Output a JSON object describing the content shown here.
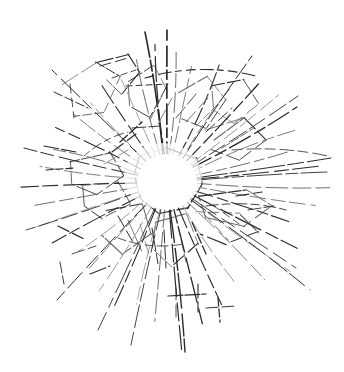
{
  "artwork": {
    "title": "Shattered glass impact star",
    "medium": "line drawing",
    "canvas": {
      "width": 344,
      "height": 372
    },
    "background_color": "#ffffff",
    "ink_color": "#2b2b2b",
    "ink_color_light": "#6e6e6e",
    "ink_color_faint": "#9a9a9a",
    "impact_center": {
      "x": 167,
      "y": 182
    },
    "core_void": {
      "label": "white impact void",
      "cx": 167,
      "cy": 182,
      "rx": 30,
      "ry": 28
    },
    "bounding_box": {
      "x": 22,
      "y": 30,
      "width": 310,
      "height": 325
    }
  },
  "chart_data": {
    "type": "scatter",
    "xlabel": "",
    "ylabel": "",
    "grid": false,
    "legend": null,
    "xlim": [
      0,
      344
    ],
    "ylim": [
      0,
      372
    ],
    "center": [
      167,
      182
    ],
    "radial_rays": [
      {
        "angle_deg": -90,
        "length": 152,
        "weight": 1.7,
        "dash": "14 5 9 4 20 6"
      },
      {
        "angle_deg": -78,
        "length": 118,
        "weight": 0.9,
        "dash": "10 5 16 4"
      },
      {
        "angle_deg": -66,
        "length": 128,
        "weight": 1.1,
        "dash": "18 4 11 5"
      },
      {
        "angle_deg": -56,
        "length": 112,
        "weight": 0.8,
        "dash": "9 4 14 5"
      },
      {
        "angle_deg": -47,
        "length": 134,
        "weight": 1.2,
        "dash": "22 5 13 4"
      },
      {
        "angle_deg": -38,
        "length": 142,
        "weight": 1.0,
        "dash": "16 4 20 6"
      },
      {
        "angle_deg": -30,
        "length": 150,
        "weight": 1.3,
        "dash": "24 5 12 4"
      },
      {
        "angle_deg": -22,
        "length": 138,
        "weight": 0.9,
        "dash": "12 4 18 5"
      },
      {
        "angle_deg": -14,
        "length": 126,
        "weight": 1.0,
        "dash": "20 5 10 4"
      },
      {
        "angle_deg": -6,
        "length": 155,
        "weight": 1.1,
        "dash": "26 6 14 4"
      },
      {
        "angle_deg": 2,
        "length": 163,
        "weight": 1.0,
        "dash": "18 5 22 5"
      },
      {
        "angle_deg": 9,
        "length": 150,
        "weight": 0.9,
        "dash": "14 4 16 6"
      },
      {
        "angle_deg": 18,
        "length": 128,
        "weight": 1.1,
        "dash": "22 5 11 4"
      },
      {
        "angle_deg": 27,
        "length": 146,
        "weight": 1.2,
        "dash": "28 6 13 4"
      },
      {
        "angle_deg": 36,
        "length": 152,
        "weight": 1.0,
        "dash": "20 5 17 5"
      },
      {
        "angle_deg": 45,
        "length": 138,
        "weight": 0.9,
        "dash": "15 4 21 6"
      },
      {
        "angle_deg": 56,
        "length": 120,
        "weight": 1.0,
        "dash": "18 5 12 4"
      },
      {
        "angle_deg": 66,
        "length": 134,
        "weight": 1.1,
        "dash": "24 5 14 4"
      },
      {
        "angle_deg": 76,
        "length": 148,
        "weight": 1.3,
        "dash": "16 4 26 6"
      },
      {
        "angle_deg": 85,
        "length": 168,
        "weight": 1.2,
        "dash": "30 6 18 5"
      },
      {
        "angle_deg": 95,
        "length": 140,
        "weight": 1.0,
        "dash": "20 5 14 4"
      },
      {
        "angle_deg": 104,
        "length": 126,
        "weight": 0.9,
        "dash": "13 4 19 5"
      },
      {
        "angle_deg": 113,
        "length": 136,
        "weight": 1.1,
        "dash": "22 5 12 4"
      },
      {
        "angle_deg": 122,
        "length": 128,
        "weight": 1.0,
        "dash": "17 4 20 6"
      },
      {
        "angle_deg": 132,
        "length": 120,
        "weight": 0.9,
        "dash": "14 5 15 4"
      },
      {
        "angle_deg": 142,
        "length": 112,
        "weight": 1.0,
        "dash": "19 4 13 5"
      },
      {
        "angle_deg": 152,
        "length": 130,
        "weight": 1.1,
        "dash": "24 5 11 4"
      },
      {
        "angle_deg": 161,
        "length": 142,
        "weight": 0.9,
        "dash": "16 5 22 6"
      },
      {
        "angle_deg": 170,
        "length": 134,
        "weight": 1.0,
        "dash": "21 4 14 5"
      },
      {
        "angle_deg": 178,
        "length": 146,
        "weight": 1.1,
        "dash": "26 6 15 4"
      },
      {
        "angle_deg": 187,
        "length": 128,
        "weight": 0.9,
        "dash": "14 4 18 5"
      },
      {
        "angle_deg": 196,
        "length": 118,
        "weight": 1.0,
        "dash": "18 5 13 4"
      },
      {
        "angle_deg": 206,
        "length": 124,
        "weight": 1.1,
        "dash": "22 5 12 5"
      },
      {
        "angle_deg": 216,
        "length": 116,
        "weight": 0.9,
        "dash": "15 4 19 5"
      },
      {
        "angle_deg": 226,
        "length": 110,
        "weight": 1.0,
        "dash": "20 5 11 4"
      },
      {
        "angle_deg": 236,
        "length": 120,
        "weight": 1.1,
        "dash": "17 4 21 6"
      },
      {
        "angle_deg": 246,
        "length": 112,
        "weight": 0.9,
        "dash": "13 5 16 4"
      },
      {
        "angle_deg": 256,
        "length": 126,
        "weight": 1.0,
        "dash": "24 5 12 4"
      },
      {
        "angle_deg": 265,
        "length": 138,
        "weight": 1.2,
        "dash": "18 4 25 6"
      },
      {
        "angle_deg": 274,
        "length": 130,
        "weight": 1.0,
        "dash": "20 5 14 5"
      }
    ],
    "long_rays": [
      {
        "from": [
          167,
          182
        ],
        "to": [
          145,
          32
        ],
        "weight": 1.6
      },
      {
        "from": [
          167,
          182
        ],
        "to": [
          185,
          352
        ],
        "weight": 1.4
      },
      {
        "from": [
          167,
          182
        ],
        "to": [
          331,
          158
        ],
        "weight": 1.0
      },
      {
        "from": [
          167,
          182
        ],
        "to": [
          327,
          172
        ],
        "weight": 0.9
      },
      {
        "from": [
          167,
          182
        ],
        "to": [
          310,
          290
        ],
        "weight": 1.0
      },
      {
        "from": [
          167,
          182
        ],
        "to": [
          296,
          268
        ],
        "weight": 0.9
      },
      {
        "from": [
          167,
          182
        ],
        "to": [
          24,
          148
        ],
        "weight": 1.0
      },
      {
        "from": [
          167,
          182
        ],
        "to": [
          26,
          230
        ],
        "weight": 0.9
      },
      {
        "from": [
          167,
          182
        ],
        "to": [
          57,
          300
        ],
        "weight": 1.0
      },
      {
        "from": [
          167,
          182
        ],
        "to": [
          98,
          330
        ],
        "weight": 0.9
      },
      {
        "from": [
          167,
          182
        ],
        "to": [
          52,
          70
        ],
        "weight": 1.0
      },
      {
        "from": [
          167,
          182
        ],
        "to": [
          252,
          56
        ],
        "weight": 1.0
      },
      {
        "from": [
          167,
          182
        ],
        "to": [
          298,
          96
        ],
        "weight": 0.9
      },
      {
        "from": [
          167,
          182
        ],
        "to": [
          131,
          345
        ],
        "weight": 0.9
      }
    ],
    "facets": [
      {
        "label": "shard-upper-left-a",
        "points": "62,84 96,62 120,76 104,112 74,116"
      },
      {
        "label": "shard-upper-left-b",
        "points": "96,62 128,54 139,72 122,94 106,80"
      },
      {
        "label": "shard-upper-mid",
        "points": "128,82 154,66 166,88 150,118 130,106"
      },
      {
        "label": "shard-upper-right-a",
        "points": "178,92 208,76 226,100 206,128 182,118"
      },
      {
        "label": "shard-upper-right-b",
        "points": "212,86 244,80 258,104 234,124 214,110"
      },
      {
        "label": "shard-right-a",
        "points": "206,130 244,118 266,140 240,160 212,150"
      },
      {
        "label": "shard-right-b",
        "points": "198,196 246,190 272,206 244,226 206,218"
      },
      {
        "label": "shard-right-c",
        "points": "196,212 240,214 258,232 226,244 200,234"
      },
      {
        "label": "shard-lower-mid",
        "points": "156,222 186,214 198,244 172,266 152,248"
      },
      {
        "label": "shard-lower-left-a",
        "points": "106,210 142,204 152,234 122,254 102,236"
      },
      {
        "label": "shard-left-a",
        "points": "70,162 110,152 124,176 96,194 72,184"
      },
      {
        "label": "shard-left-b",
        "points": "82,186 118,182 130,204 102,218 84,206"
      },
      {
        "label": "shard-core-ring",
        "points": "140,156 166,148 196,158 202,184 188,208 160,214 140,198 134,174"
      }
    ],
    "arcs": [
      {
        "label": "upper-dashed-arc",
        "d": "M145,78 Q200,62 256,76",
        "weight": 1.1,
        "dash": "9 5 13 4 6 5"
      },
      {
        "label": "inner-arc-left",
        "d": "M84,156 Q104,138 128,132",
        "weight": 0.8,
        "dash": "7 4 10 4"
      },
      {
        "label": "inner-arc-right",
        "d": "M206,206 Q250,200 286,210",
        "weight": 0.9,
        "dash": "12 4 8 5"
      },
      {
        "label": "inner-arc-lower",
        "d": "M118,238 Q150,250 184,244",
        "weight": 0.8,
        "dash": "8 4 11 5"
      },
      {
        "label": "outer-arc-right",
        "d": "M232,150 Q282,146 328,156",
        "weight": 0.8,
        "dash": "10 5 14 4"
      }
    ],
    "tick_marks": [
      {
        "label": "tick-vertical-top",
        "d": "M126,86 L168,84"
      },
      {
        "label": "tick-vertical-upper",
        "d": "M132,128 L160,126"
      },
      {
        "label": "tick-upper-left-1",
        "d": "M54,92 L88,108"
      },
      {
        "label": "tick-upper-left-2",
        "d": "M70,84 L74,118"
      },
      {
        "label": "tick-upper-left-3",
        "d": "M100,66 L128,58"
      },
      {
        "label": "tick-upper-left-4",
        "d": "M112,78 L136,70"
      },
      {
        "label": "tick-lower-left-1",
        "d": "M58,226 L86,240"
      },
      {
        "label": "tick-lower-left-2",
        "d": "M72,254 L96,246"
      },
      {
        "label": "tick-lower-left-3",
        "d": "M90,274 L110,266"
      },
      {
        "label": "tick-lower-left-4",
        "d": "M60,262 L64,284"
      },
      {
        "label": "tick-bottom-1",
        "d": "M176,288 L176,318"
      },
      {
        "label": "tick-bottom-2",
        "d": "M198,284 L198,312"
      },
      {
        "label": "tick-bottom-3",
        "d": "M168,296 L206,294"
      },
      {
        "label": "tick-bottom-4",
        "d": "M206,308 L236,306"
      },
      {
        "label": "tick-bottom-5",
        "d": "M218,298 L220,322"
      },
      {
        "label": "tick-right-1",
        "d": "M236,196 L262,192"
      },
      {
        "label": "tick-right-2",
        "d": "M248,210 L274,206"
      },
      {
        "label": "tick-left-1",
        "d": "M44,146 L76,152"
      },
      {
        "label": "tick-left-2",
        "d": "M46,170 L74,168"
      }
    ],
    "hatch_strokes": [
      {
        "d": "M150,120 L162,96"
      },
      {
        "d": "M158,124 L172,98"
      },
      {
        "d": "M176,118 L196,94"
      },
      {
        "d": "M186,122 L208,98"
      },
      {
        "d": "M196,126 L220,102"
      },
      {
        "d": "M206,132 L232,108"
      },
      {
        "d": "M214,140 L244,118"
      },
      {
        "d": "M222,148 L254,128"
      },
      {
        "d": "M120,142 L142,122"
      },
      {
        "d": "M112,152 L136,134"
      },
      {
        "d": "M104,164 L128,150"
      },
      {
        "d": "M118,216 L134,244"
      },
      {
        "d": "M128,220 L142,252"
      },
      {
        "d": "M140,224 L150,258"
      },
      {
        "d": "M152,228 L158,264"
      },
      {
        "d": "M164,230 L166,268"
      },
      {
        "d": "M178,226 L186,262"
      },
      {
        "d": "M192,222 L206,254"
      },
      {
        "d": "M204,214 L228,240"
      },
      {
        "d": "M214,206 L242,226"
      }
    ]
  }
}
